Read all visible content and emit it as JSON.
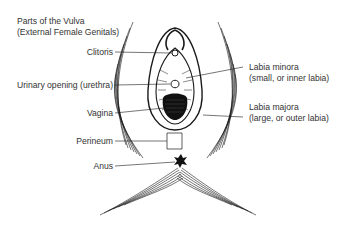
{
  "title": {
    "line1": "Parts of the Vulva",
    "line2": "(External Female Genitals)"
  },
  "labels": {
    "clitoris": "Clitoris",
    "urethra": "Urinary opening (urethra)",
    "vagina": "Vagina",
    "perineum": "Perineum",
    "anus": "Anus",
    "labia_minora": "Labia minora",
    "labia_minora_desc": "(small, or inner labia)",
    "labia_majora": "Labia majora",
    "labia_majora_desc": "(large, or outer labia)"
  },
  "colors": {
    "line": "#1a1a1a",
    "text": "#333333",
    "background": "#ffffff"
  }
}
